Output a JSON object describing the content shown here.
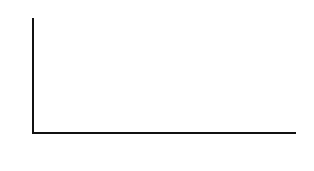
{
  "chart_data": {
    "type": "bar",
    "title": "",
    "xlabel": "",
    "ylabel": "Profits",
    "categories": [
      "1987",
      "1988",
      "1989",
      "1990"
    ],
    "values": [
      0.3,
      0.65,
      0.85,
      1.2
    ],
    "bar_widths_relative": [
      1,
      1,
      1,
      4
    ],
    "ylim": [
      0,
      2
    ],
    "yticks": [
      "2"
    ],
    "grid": false,
    "legend": null
  },
  "axis": {
    "y_top_label": "2",
    "y_title": "Profits"
  }
}
